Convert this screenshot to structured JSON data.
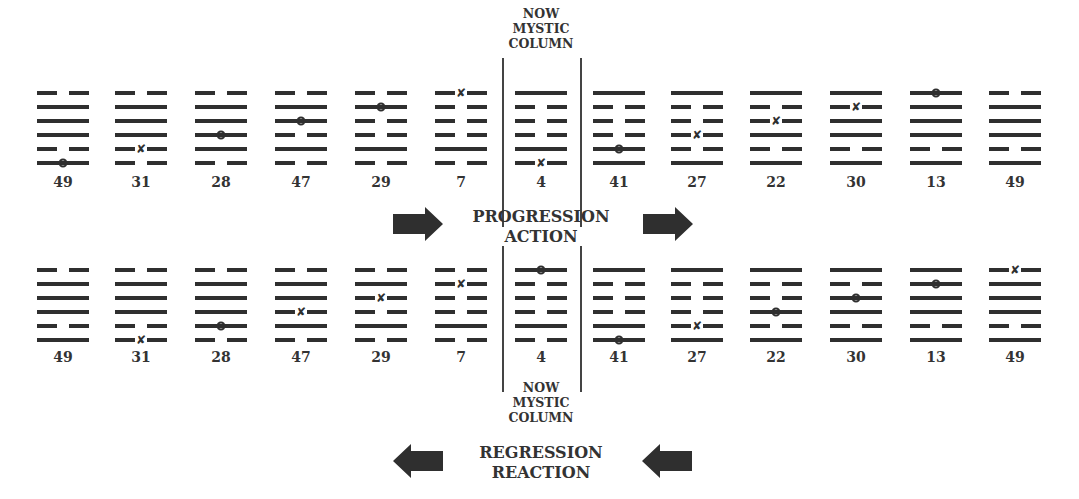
{
  "top_caption": [
    "NOW",
    "MYSTIC",
    "COLUMN"
  ],
  "bottom_caption": [
    "NOW",
    "MYSTIC",
    "COLUMN"
  ],
  "progression": {
    "line1": "PROGRESSION",
    "line2": "ACTION",
    "direction": "right"
  },
  "regression": {
    "line1": "REGRESSION",
    "line2": "REACTION",
    "direction": "left"
  },
  "legend_notes": {
    "o": "moving yang line (circle)",
    "x": "moving yin line (cross)"
  },
  "colors": {
    "ink": "#2f2f2f",
    "background": "#ffffff"
  },
  "top_row": [
    {
      "number": "49",
      "lines": [
        "broken",
        "solid",
        "solid",
        "solid",
        "broken",
        "solid"
      ],
      "marks": [
        null,
        null,
        null,
        null,
        null,
        "o"
      ]
    },
    {
      "number": "31",
      "lines": [
        "broken",
        "solid",
        "solid",
        "solid",
        "broken",
        "broken"
      ],
      "marks": [
        null,
        null,
        null,
        null,
        "x",
        null
      ]
    },
    {
      "number": "28",
      "lines": [
        "broken",
        "solid",
        "solid",
        "solid",
        "solid",
        "broken"
      ],
      "marks": [
        null,
        null,
        null,
        "o",
        null,
        null
      ]
    },
    {
      "number": "47",
      "lines": [
        "broken",
        "solid",
        "solid",
        "broken",
        "solid",
        "broken"
      ],
      "marks": [
        null,
        null,
        "o",
        null,
        null,
        null
      ]
    },
    {
      "number": "29",
      "lines": [
        "broken",
        "solid",
        "broken",
        "broken",
        "solid",
        "broken"
      ],
      "marks": [
        null,
        "o",
        null,
        null,
        null,
        null
      ]
    },
    {
      "number": "7",
      "lines": [
        "broken",
        "broken",
        "broken",
        "broken",
        "solid",
        "broken"
      ],
      "marks": [
        "x",
        null,
        null,
        null,
        null,
        null
      ]
    },
    {
      "number": "4",
      "lines": [
        "solid",
        "broken",
        "broken",
        "broken",
        "solid",
        "broken"
      ],
      "marks": [
        null,
        null,
        null,
        null,
        null,
        "x"
      ]
    },
    {
      "number": "41",
      "lines": [
        "solid",
        "broken",
        "broken",
        "broken",
        "solid",
        "solid"
      ],
      "marks": [
        null,
        null,
        null,
        null,
        "o",
        null
      ]
    },
    {
      "number": "27",
      "lines": [
        "solid",
        "broken",
        "broken",
        "broken",
        "broken",
        "solid"
      ],
      "marks": [
        null,
        null,
        null,
        "x",
        null,
        null
      ]
    },
    {
      "number": "22",
      "lines": [
        "solid",
        "broken",
        "broken",
        "solid",
        "broken",
        "solid"
      ],
      "marks": [
        null,
        null,
        "x",
        null,
        null,
        null
      ]
    },
    {
      "number": "30",
      "lines": [
        "solid",
        "broken",
        "solid",
        "solid",
        "broken",
        "solid"
      ],
      "marks": [
        null,
        "x",
        null,
        null,
        null,
        null
      ]
    },
    {
      "number": "13",
      "lines": [
        "solid",
        "solid",
        "solid",
        "solid",
        "broken",
        "solid"
      ],
      "marks": [
        "o",
        null,
        null,
        null,
        null,
        null
      ]
    },
    {
      "number": "49",
      "lines": [
        "broken",
        "solid",
        "solid",
        "solid",
        "broken",
        "solid"
      ],
      "marks": [
        null,
        null,
        null,
        null,
        null,
        null
      ]
    }
  ],
  "bottom_row": [
    {
      "number": "49",
      "lines": [
        "broken",
        "solid",
        "solid",
        "solid",
        "broken",
        "solid"
      ],
      "marks": [
        null,
        null,
        null,
        null,
        null,
        null
      ]
    },
    {
      "number": "31",
      "lines": [
        "broken",
        "solid",
        "solid",
        "solid",
        "broken",
        "broken"
      ],
      "marks": [
        null,
        null,
        null,
        null,
        null,
        "x"
      ]
    },
    {
      "number": "28",
      "lines": [
        "broken",
        "solid",
        "solid",
        "solid",
        "solid",
        "broken"
      ],
      "marks": [
        null,
        null,
        null,
        null,
        "o",
        null
      ]
    },
    {
      "number": "47",
      "lines": [
        "broken",
        "solid",
        "solid",
        "broken",
        "solid",
        "broken"
      ],
      "marks": [
        null,
        null,
        null,
        "x",
        null,
        null
      ]
    },
    {
      "number": "29",
      "lines": [
        "broken",
        "solid",
        "broken",
        "broken",
        "solid",
        "broken"
      ],
      "marks": [
        null,
        null,
        "x",
        null,
        null,
        null
      ]
    },
    {
      "number": "7",
      "lines": [
        "broken",
        "broken",
        "broken",
        "broken",
        "solid",
        "broken"
      ],
      "marks": [
        null,
        "x",
        null,
        null,
        null,
        null
      ]
    },
    {
      "number": "4",
      "lines": [
        "solid",
        "broken",
        "broken",
        "broken",
        "solid",
        "broken"
      ],
      "marks": [
        "o",
        null,
        null,
        null,
        null,
        null
      ]
    },
    {
      "number": "41",
      "lines": [
        "solid",
        "broken",
        "broken",
        "broken",
        "solid",
        "solid"
      ],
      "marks": [
        null,
        null,
        null,
        null,
        null,
        "o"
      ]
    },
    {
      "number": "27",
      "lines": [
        "solid",
        "broken",
        "broken",
        "broken",
        "broken",
        "solid"
      ],
      "marks": [
        null,
        null,
        null,
        null,
        "x",
        null
      ]
    },
    {
      "number": "22",
      "lines": [
        "solid",
        "broken",
        "broken",
        "solid",
        "broken",
        "solid"
      ],
      "marks": [
        null,
        null,
        null,
        "o",
        null,
        null
      ]
    },
    {
      "number": "30",
      "lines": [
        "solid",
        "broken",
        "solid",
        "solid",
        "broken",
        "solid"
      ],
      "marks": [
        null,
        null,
        "o",
        null,
        null,
        null
      ]
    },
    {
      "number": "13",
      "lines": [
        "solid",
        "solid",
        "solid",
        "solid",
        "broken",
        "solid"
      ],
      "marks": [
        null,
        "o",
        null,
        null,
        null,
        null
      ]
    },
    {
      "number": "49",
      "lines": [
        "broken",
        "solid",
        "solid",
        "solid",
        "broken",
        "solid"
      ],
      "marks": [
        "x",
        null,
        null,
        null,
        null,
        null
      ]
    }
  ]
}
